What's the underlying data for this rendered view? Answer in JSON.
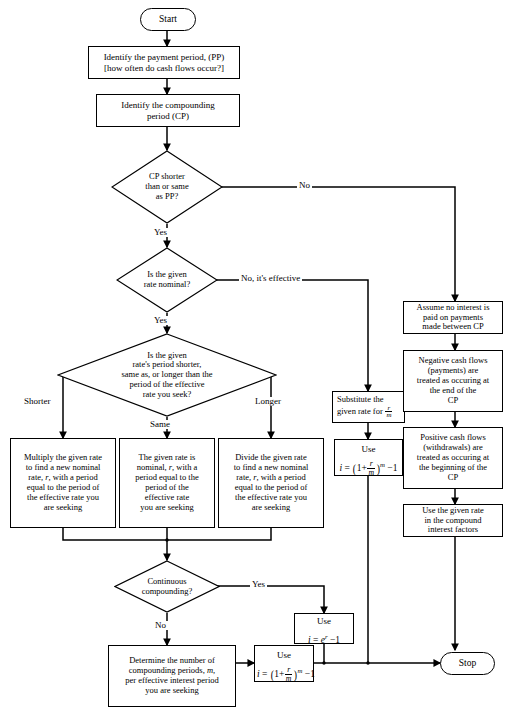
{
  "figure": {
    "type": "flowchart"
  },
  "nodes": {
    "start": {
      "label": "Start",
      "shape": "terminator"
    },
    "stop": {
      "label": "Stop",
      "shape": "terminator"
    },
    "identify_pp": {
      "line1": "Identify the payment period, (PP)",
      "line2": "[how often do cash flows occur?]",
      "shape": "process"
    },
    "identify_cp": {
      "line1": "Identify the compounding",
      "line2": "period (CP)",
      "shape": "process"
    },
    "d_cp_pp": {
      "line1": "CP shorter",
      "line2": "than or same",
      "line3": "as PP?",
      "shape": "decision"
    },
    "d_nominal": {
      "line1": "Is the given",
      "line2": "rate nominal?",
      "shape": "decision"
    },
    "d_period": {
      "line1": "Is the given",
      "line2": "rate's period shorter,",
      "line3": "same as, or longer than the",
      "line4": "period of the effective",
      "line5": "rate you seek?",
      "shape": "decision"
    },
    "multiply": {
      "line1": "Multiply the given rate",
      "line2": "to find a new nominal",
      "line3_a": "rate, ",
      "line3_i": "r",
      "line3_b": ", with a period",
      "line4": "equal to the period of",
      "line5": "the effective rate you",
      "line6": "are seeking",
      "shape": "process"
    },
    "same_nominal": {
      "line1": "The given rate is",
      "line2_a": "nominal, ",
      "line2_i": "r",
      "line2_b": ", with a",
      "line3": "period equal to the",
      "line4": "period of the",
      "line5": "effective rate",
      "line6": "you are seeking",
      "shape": "process"
    },
    "divide": {
      "line1": "Divide the given rate",
      "line2": "to find a new nominal",
      "line3_a": "rate, ",
      "line3_i": "r",
      "line3_b": ", with a period",
      "line4": "equal to the period of",
      "line5": "the effective rate you",
      "line6": "are seeking",
      "shape": "process"
    },
    "d_continuous": {
      "line1": "Continuous",
      "line2": "compounding?",
      "shape": "decision"
    },
    "determine_m": {
      "line1": "Determine the number of",
      "line2_a": "compounding periods, ",
      "line2_i": "m",
      "line2_b": ",",
      "line3": "per effective interest period",
      "line4": "you are seeking",
      "shape": "process"
    },
    "use_eff_bottom": {
      "label": "Use",
      "formula_text": "i = (1 + r/m)^m - 1",
      "shape": "process"
    },
    "use_continuous": {
      "label": "Use",
      "formula_text": "i = e^r - 1",
      "shape": "process"
    },
    "substitute": {
      "line1": "Substitute the",
      "line2_a": "given rate for ",
      "line2_frac": "r/m",
      "shape": "process"
    },
    "use_eff_right": {
      "label": "Use",
      "formula_text": "i = (1 + r/m)^m - 1",
      "shape": "process"
    },
    "assume_no_interest": {
      "line1": "Assume no interest is",
      "line2": "paid on payments",
      "line3": "made between CP",
      "shape": "process"
    },
    "negative_cash": {
      "line1": "Negative cash flows",
      "line2": "(payments) are",
      "line3": "treated as occuring at",
      "line4": "the end of the",
      "line5": "CP",
      "shape": "process"
    },
    "positive_cash": {
      "line1": "Positive cash flows",
      "line2": "(withdrawals) are",
      "line3": "treated as occuring at",
      "line4": "the beginning of the",
      "line5": "CP",
      "shape": "process"
    },
    "use_given_rate": {
      "line1": "Use the given rate",
      "line2": "in the compound",
      "line3": "interest factors",
      "shape": "process"
    }
  },
  "edge_labels": {
    "no_cp_pp": "No",
    "yes_cp_pp": "Yes",
    "no_effective": "No, it's effective",
    "yes_nominal": "Yes",
    "shorter": "Shorter",
    "same": "Same",
    "longer": "Longer",
    "yes_continuous": "Yes",
    "no_continuous": "No"
  },
  "symbols": {
    "frac_num": "r",
    "frac_den": "m",
    "i": "i",
    "equals": "=",
    "one_plus": "1+",
    "exp_m": "m",
    "minus_one": "−1",
    "e": "e",
    "exp_r": "r"
  },
  "colors": {
    "stroke": "#000000",
    "fill": "#ffffff",
    "text": "#000000"
  }
}
